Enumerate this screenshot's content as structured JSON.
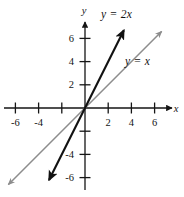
{
  "figure": {
    "background": "#ffffff",
    "width": 184,
    "height": 197
  },
  "axes": {
    "x_axis_name": "x",
    "y_axis_name": "y",
    "origin_px": {
      "x": 85,
      "y": 108
    },
    "unit_px": 11.6,
    "axis_color": "#151515",
    "x_ticks": [
      {
        "value": -6,
        "label": "-6"
      },
      {
        "value": -4,
        "label": "-4"
      },
      {
        "value": -2,
        "label": ""
      },
      {
        "value": 2,
        "label": "2"
      },
      {
        "value": 4,
        "label": "4"
      },
      {
        "value": 6,
        "label": "6"
      }
    ],
    "y_ticks": [
      {
        "value": 6,
        "label": "6"
      },
      {
        "value": 4,
        "label": "4"
      },
      {
        "value": 2,
        "label": "2"
      },
      {
        "value": -2,
        "label": ""
      },
      {
        "value": -4,
        "label": "-4"
      },
      {
        "value": -6,
        "label": "-6"
      }
    ]
  },
  "chart_data": {
    "type": "line",
    "title": "",
    "xlabel": "x",
    "ylabel": "y",
    "xlim": [
      -7.3,
      7.6
    ],
    "ylim": [
      -7.6,
      7.3
    ],
    "grid": false,
    "legend": "inline-annotations",
    "series": [
      {
        "name": "y = 2x",
        "label": "y = 2x",
        "slope": 2,
        "intercept": 0,
        "color": "#111111",
        "width": 2.1,
        "arrows": "both",
        "x": [
          -3.1,
          3.35
        ],
        "values": [
          -6.2,
          6.7
        ]
      },
      {
        "name": "y = x",
        "label": "y = x",
        "slope": 1,
        "intercept": 0,
        "color": "#8d8d8d",
        "width": 1.5,
        "arrows": "both",
        "x": [
          -6.6,
          6.6
        ],
        "values": [
          -6.6,
          6.6
        ]
      }
    ]
  },
  "annotations": {
    "line_2x_label": "y = 2x",
    "line_x_label": "y = x"
  }
}
